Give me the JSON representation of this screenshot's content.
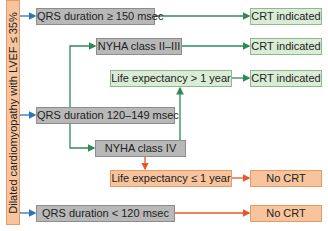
{
  "diagram": {
    "root_label": "Dilated cardiomyopathy with LVEF ≤ 35%",
    "nodes": {
      "qrs_ge150": "QRS duration ≥ 150 msec",
      "qrs_120_149": "QRS duration 120–149 msec",
      "qrs_lt120": "QRS duration < 120 msec",
      "nyha_2_3": "NYHA class II–III",
      "nyha_4": "NYHA class IV",
      "life_gt1": "Life expectancy > 1 year",
      "life_le1": "Life expectancy ≤ 1 year",
      "out_1": "CRT indicated",
      "out_2": "CRT indicated",
      "out_3": "CRT indicated",
      "out_4": "No CRT",
      "out_5": "No CRT"
    },
    "colors": {
      "blue_arrow": "#2e75b6",
      "green_arrow": "#2e8b57",
      "orange_arrow": "#e8562a",
      "grey_box": "#b8b8b8",
      "green_box": "#d9ecd6",
      "orange_box": "#f8c49d"
    }
  }
}
